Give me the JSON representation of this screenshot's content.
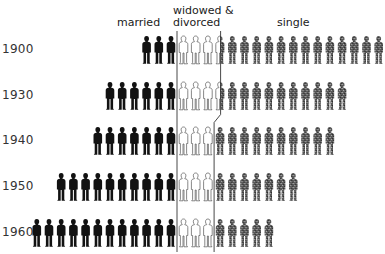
{
  "chart_data": {
    "type": "pictograph",
    "title": "",
    "unit": "figure",
    "categories": [
      "1900",
      "1930",
      "1940",
      "1950",
      "1960"
    ],
    "series": [
      {
        "name": "married",
        "values": [
          3,
          6,
          7,
          10,
          12
        ],
        "color": "#111111"
      },
      {
        "name": "widowed & divorced",
        "values": [
          3.5,
          3.5,
          3,
          3,
          3
        ],
        "color": "#ffffff"
      },
      {
        "name": "single",
        "values": [
          13.5,
          10.5,
          10,
          7,
          5
        ],
        "color": "#6a6a6a"
      }
    ],
    "legend": {
      "married": "married",
      "widowed_line1": "widowed &",
      "widowed_line2": "divorced",
      "single": "single"
    }
  }
}
